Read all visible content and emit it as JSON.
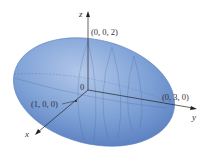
{
  "figure": {
    "type": "ellipsoid",
    "fill_color": "#7ea1d6",
    "edge_color": "#4a6fae",
    "axes": {
      "x_label": "x",
      "y_label": "y",
      "z_label": "z"
    },
    "points": {
      "origin": "0",
      "z_intercept": "(0, 0, 2)",
      "y_intercept": "(0, 3, 0)",
      "x_intercept": "(1, 0, 0)"
    }
  }
}
